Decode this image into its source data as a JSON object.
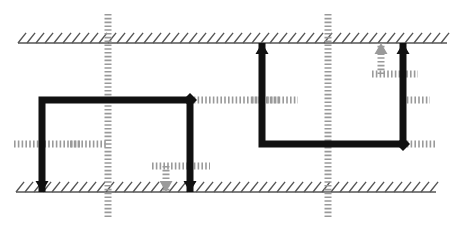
{
  "canvas": {
    "width": 454,
    "height": 244,
    "background": "#ffffff",
    "title": "schematic-line-diagram"
  },
  "colors": {
    "solid": "#111111",
    "dotted": "#9a9a9a",
    "hatch": "#555555",
    "background": "#ffffff"
  },
  "strokes": {
    "solid_width": 7,
    "dotted_width": 7,
    "hatch_width": 1.4
  },
  "boundaries": [
    {
      "name": "top-hatched-boundary",
      "x1": 18,
      "y1": 43,
      "x2": 447,
      "y2": 43,
      "hatch_direction": "up-right",
      "hatch_spacing": 9,
      "hatch_length": 13
    },
    {
      "name": "bottom-hatched-boundary",
      "x1": 16,
      "y1": 192,
      "x2": 436,
      "y2": 192,
      "hatch_direction": "up-right",
      "hatch_spacing": 9,
      "hatch_length": 13
    }
  ],
  "solid_paths": [
    {
      "name": "left-solid-network",
      "points": "42,192 42,100 190,100"
    },
    {
      "name": "left-branch-to-top",
      "points": "190,100 190,192"
    },
    {
      "name": "center-solid-riser",
      "points": "262,43 262,144 403,144"
    },
    {
      "name": "right-solid-riser",
      "points": "403,43 403,144"
    }
  ],
  "dotted_paths": [
    {
      "name": "vertical-dotted-left",
      "points": "108,14 108,217"
    },
    {
      "name": "vertical-dotted-right",
      "points": "328,14 328,217"
    },
    {
      "name": "horizontal-dotted-far-left",
      "points": "14,144 80,144"
    },
    {
      "name": "horizontal-dotted-left-mid",
      "points": "70,144 108,144"
    },
    {
      "name": "horizontal-dotted-branch-low",
      "points": "152,166 210,166"
    },
    {
      "name": "dotted-arrow-stem-low",
      "points": "166,166 166,192"
    },
    {
      "name": "horizontal-dotted-center",
      "points": "190,100 280,100"
    },
    {
      "name": "horizontal-dotted-center-right",
      "points": "252,100 298,100"
    },
    {
      "name": "horizontal-dotted-right-upper",
      "points": "372,74 418,74"
    },
    {
      "name": "dotted-arrow-stem-right-upper",
      "points": "381,74 381,43"
    },
    {
      "name": "horizontal-dotted-far-right",
      "points": "403,144 436,144"
    },
    {
      "name": "horizontal-dotted-top-right-stub",
      "points": "403,100 430,100"
    }
  ],
  "arrowheads": [
    {
      "name": "arrow-up-center",
      "x": 262,
      "y": 43,
      "dir": "up",
      "style": "solid"
    },
    {
      "name": "arrow-up-right",
      "x": 403,
      "y": 43,
      "dir": "up",
      "style": "solid"
    },
    {
      "name": "arrow-up-right-dotted",
      "x": 381,
      "y": 43,
      "dir": "up",
      "style": "dotted"
    },
    {
      "name": "arrow-down-left",
      "x": 42,
      "y": 192,
      "dir": "down",
      "style": "solid"
    },
    {
      "name": "arrow-down-mid",
      "x": 190,
      "y": 192,
      "dir": "down",
      "style": "solid"
    },
    {
      "name": "arrow-down-mid-dotted",
      "x": 166,
      "y": 192,
      "dir": "down",
      "style": "dotted"
    }
  ],
  "terminals": [
    {
      "name": "terminal-diamond-right",
      "x": 403,
      "y": 144,
      "style": "solid"
    },
    {
      "name": "terminal-diamond-mid",
      "x": 190,
      "y": 100,
      "style": "solid"
    }
  ],
  "legend": {
    "solid_label": "solid conductor path",
    "dotted_label": "dotted / dashed path",
    "hatch_label": "hatched boundary plane"
  }
}
